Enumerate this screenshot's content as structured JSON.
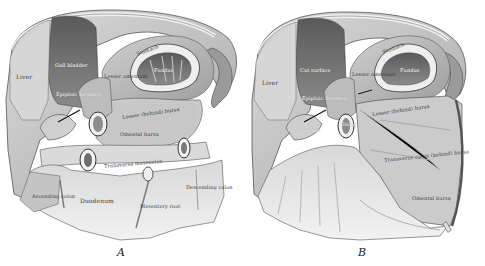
{
  "figure": {
    "type": "anatomical-illustration",
    "panels": [
      {
        "id": "A",
        "caption": "A",
        "labels": {
          "diaphragm": "Diaphragm",
          "liver": "Liver",
          "gall_bladder": "Gall bladder",
          "epiploic_foramen": "Epiploic foramen",
          "lesser_omentum": "Lesser omentum",
          "stomach": "Stomach",
          "fundus": "Fundus",
          "lesser_omental_bursa": "Lesser (behind) bursa",
          "omental_bursa": "Omental bursa",
          "transverse_mesocolon": "Transverse mesocolon",
          "ascending_colon": "Ascending colon",
          "duodenum": "Duodenum",
          "mesentery_root": "Mesentery root",
          "descending_colon": "Descending colon"
        }
      },
      {
        "id": "B",
        "caption": "B",
        "labels": {
          "diaphragm": "Diaphragm",
          "liver": "Liver",
          "cut_surface": "Cut surface",
          "lesser_omentum": "Lesser omentum",
          "stomach": "Stomach",
          "fundus": "Fundus",
          "epiploic_foramen": "Epiploic foramen",
          "gall_bladder": "Gall bladder",
          "duodenum": "Duod.",
          "lesser_omental_bursa": "Lesser (behind) bursa",
          "transverse_colon_bursa": "Transverse colon (behind) bursa",
          "omental_bursa": "Omental bursa"
        }
      }
    ],
    "colors": {
      "background": "#ffffff",
      "tissue_light": "#e4e4e4",
      "tissue_mid": "#b8b8b8",
      "tissue_dark": "#6e6e6e",
      "outline": "#4a4a4a"
    }
  }
}
